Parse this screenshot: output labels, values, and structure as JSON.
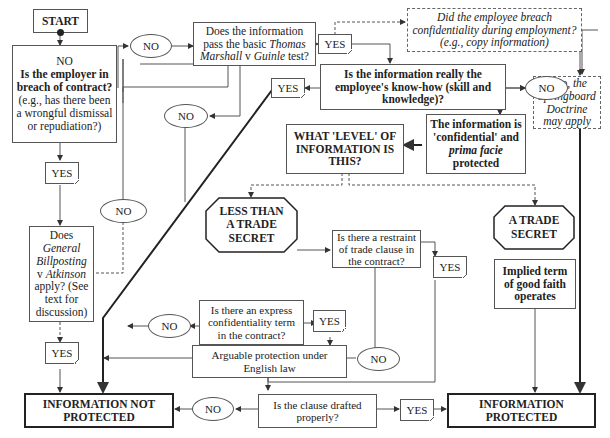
{
  "flowchart": {
    "start": "START",
    "q_breach": {
      "prefix": "NO",
      "bold": "Is the employer in breach of contract?",
      "rest": "(e.g., has there been a wrongful dismissal or repudiation?)"
    },
    "q_thomas_marshall": {
      "l1": "Does the information",
      "l2a": "pass the basic ",
      "l2b": "Thomas",
      "l3a": "Marshall",
      "l3b": " v ",
      "l3c": "Guinle",
      "l3d": " test?"
    },
    "q_springboard_breach": "Did the employee breach confidentiality during employment? (e.g., copy information)",
    "springboard_note": "If so, the Springboard Doctrine may apply",
    "q_know_how": "Is the information really the employee's know-how (skill and knowledge)?",
    "confidential": {
      "l1": "The information is 'confidential' and ",
      "italic": "prima facie",
      "l2": " protected"
    },
    "what_level": "WHAT 'LEVEL' OF INFORMATION IS THIS?",
    "less_than_trade_secret": "LESS THAN A TRADE SECRET",
    "trade_secret": "A TRADE SECRET",
    "q_restraint": "Is there a restraint of trade clause in the contract?",
    "implied_term": "Implied term of good faith operates",
    "q_express_term": "Is there an express confidentiality term in the contract?",
    "arguable": "Arguable protection under English law",
    "q_billposting": {
      "l1": "Does",
      "i1": "General Billposting",
      "l2": " v ",
      "i2": "Atkinson",
      "l3": " apply? (See text for discussion)"
    },
    "q_drafted": "Is the clause drafted properly?",
    "not_protected": "INFORMATION NOT PROTECTED",
    "protected": "INFORMATION PROTECTED",
    "labels": {
      "yes": "YES",
      "no": "NO"
    }
  }
}
